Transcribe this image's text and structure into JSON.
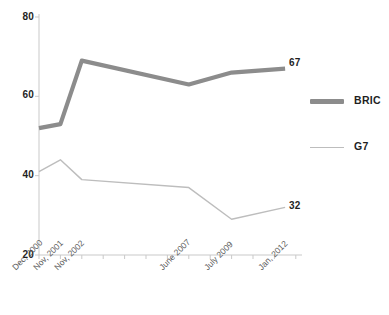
{
  "chart_data": {
    "type": "line",
    "title": "",
    "subtitle": "",
    "xlabel": "",
    "ylabel": "",
    "categories": [
      "Dec, 2000",
      "Nov, 2001",
      "Nov, 2002",
      "June 2007",
      "July 2009",
      "Jan, 2012"
    ],
    "ylim": [
      20,
      80
    ],
    "yticks": [
      20,
      40,
      60,
      80
    ],
    "ytick_labels": [
      "20",
      "40",
      "60",
      "80"
    ],
    "grid": false,
    "legend_position": "right",
    "series": [
      {
        "name": "BRIC",
        "color": "#8c8c8c",
        "line_width": "thick",
        "values": [
          52,
          53,
          69,
          63,
          66,
          67
        ],
        "end_label": "67"
      },
      {
        "name": "G7",
        "color": "#bdbdbd",
        "line_width": "thin",
        "values": [
          41,
          44,
          39,
          37,
          29,
          32
        ],
        "end_label": "32"
      }
    ],
    "annotations": [
      {
        "text": "67",
        "series": "BRIC",
        "at_category": "Jan, 2012"
      },
      {
        "text": "32",
        "series": "G7",
        "at_category": "Jan, 2012"
      }
    ]
  },
  "axes": {
    "axis_color": "#c9c9c9",
    "tick_color": "#c9c9c9"
  }
}
